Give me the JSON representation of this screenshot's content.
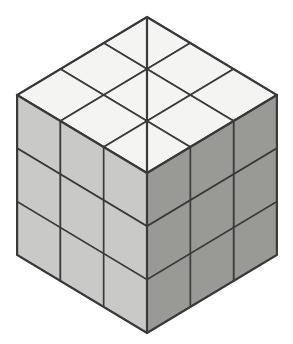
{
  "figure": {
    "title": "Isometric Cube",
    "shape_name": "cube",
    "subdivisions": 3,
    "total_unit_cubes": 27,
    "visible_unit_faces": 27,
    "background_color": "#ffffff",
    "projection": "isometric",
    "canvas": {
      "width": 293,
      "height": 344
    }
  },
  "style": {
    "stroke_color": "#3a3a3a",
    "stroke_width_grid": 1.6,
    "stroke_width_outline": 2.2,
    "top_face_color": "#f4f4f2",
    "left_face_color": "#c9c9c7",
    "right_face_color": "#999996"
  },
  "geometry": {
    "apex_top": {
      "x": 147,
      "y": 17
    },
    "corner_left": {
      "x": 17,
      "y": 95
    },
    "corner_right": {
      "x": 277,
      "y": 96
    },
    "center_front_top": {
      "x": 146,
      "y": 167
    },
    "corner_bottom_left": {
      "x": 17,
      "y": 253
    },
    "corner_bottom_right": {
      "x": 277,
      "y": 253
    },
    "corner_bottom_center": {
      "x": 146,
      "y": 327
    },
    "step_u": {
      "x": 43.3,
      "y": 26.0
    },
    "step_v": {
      "x": -43.3,
      "y": 26.0
    },
    "step_down": {
      "x": 0,
      "y": 53.3
    }
  },
  "faces": [
    {
      "id": "top",
      "name": "top-face",
      "label": "Top face",
      "color": "#f4f4f2",
      "rows": 3,
      "cols": 3,
      "cells": [
        "top-r0-c0",
        "top-r0-c1",
        "top-r0-c2",
        "top-r1-c0",
        "top-r1-c1",
        "top-r1-c2",
        "top-r2-c0",
        "top-r2-c1",
        "top-r2-c2"
      ]
    },
    {
      "id": "left",
      "name": "left-face",
      "label": "Left face",
      "color": "#c9c9c7",
      "rows": 3,
      "cols": 3,
      "cells": [
        "left-r0-c0",
        "left-r0-c1",
        "left-r0-c2",
        "left-r1-c0",
        "left-r1-c1",
        "left-r1-c2",
        "left-r2-c0",
        "left-r2-c1",
        "left-r2-c2"
      ]
    },
    {
      "id": "right",
      "name": "right-face",
      "label": "Right face",
      "color": "#999996",
      "rows": 3,
      "cols": 3,
      "cells": [
        "right-r0-c0",
        "right-r0-c1",
        "right-r0-c2",
        "right-r1-c0",
        "right-r1-c1",
        "right-r1-c2",
        "right-r2-c0",
        "right-r2-c1",
        "right-r2-c2"
      ]
    }
  ]
}
